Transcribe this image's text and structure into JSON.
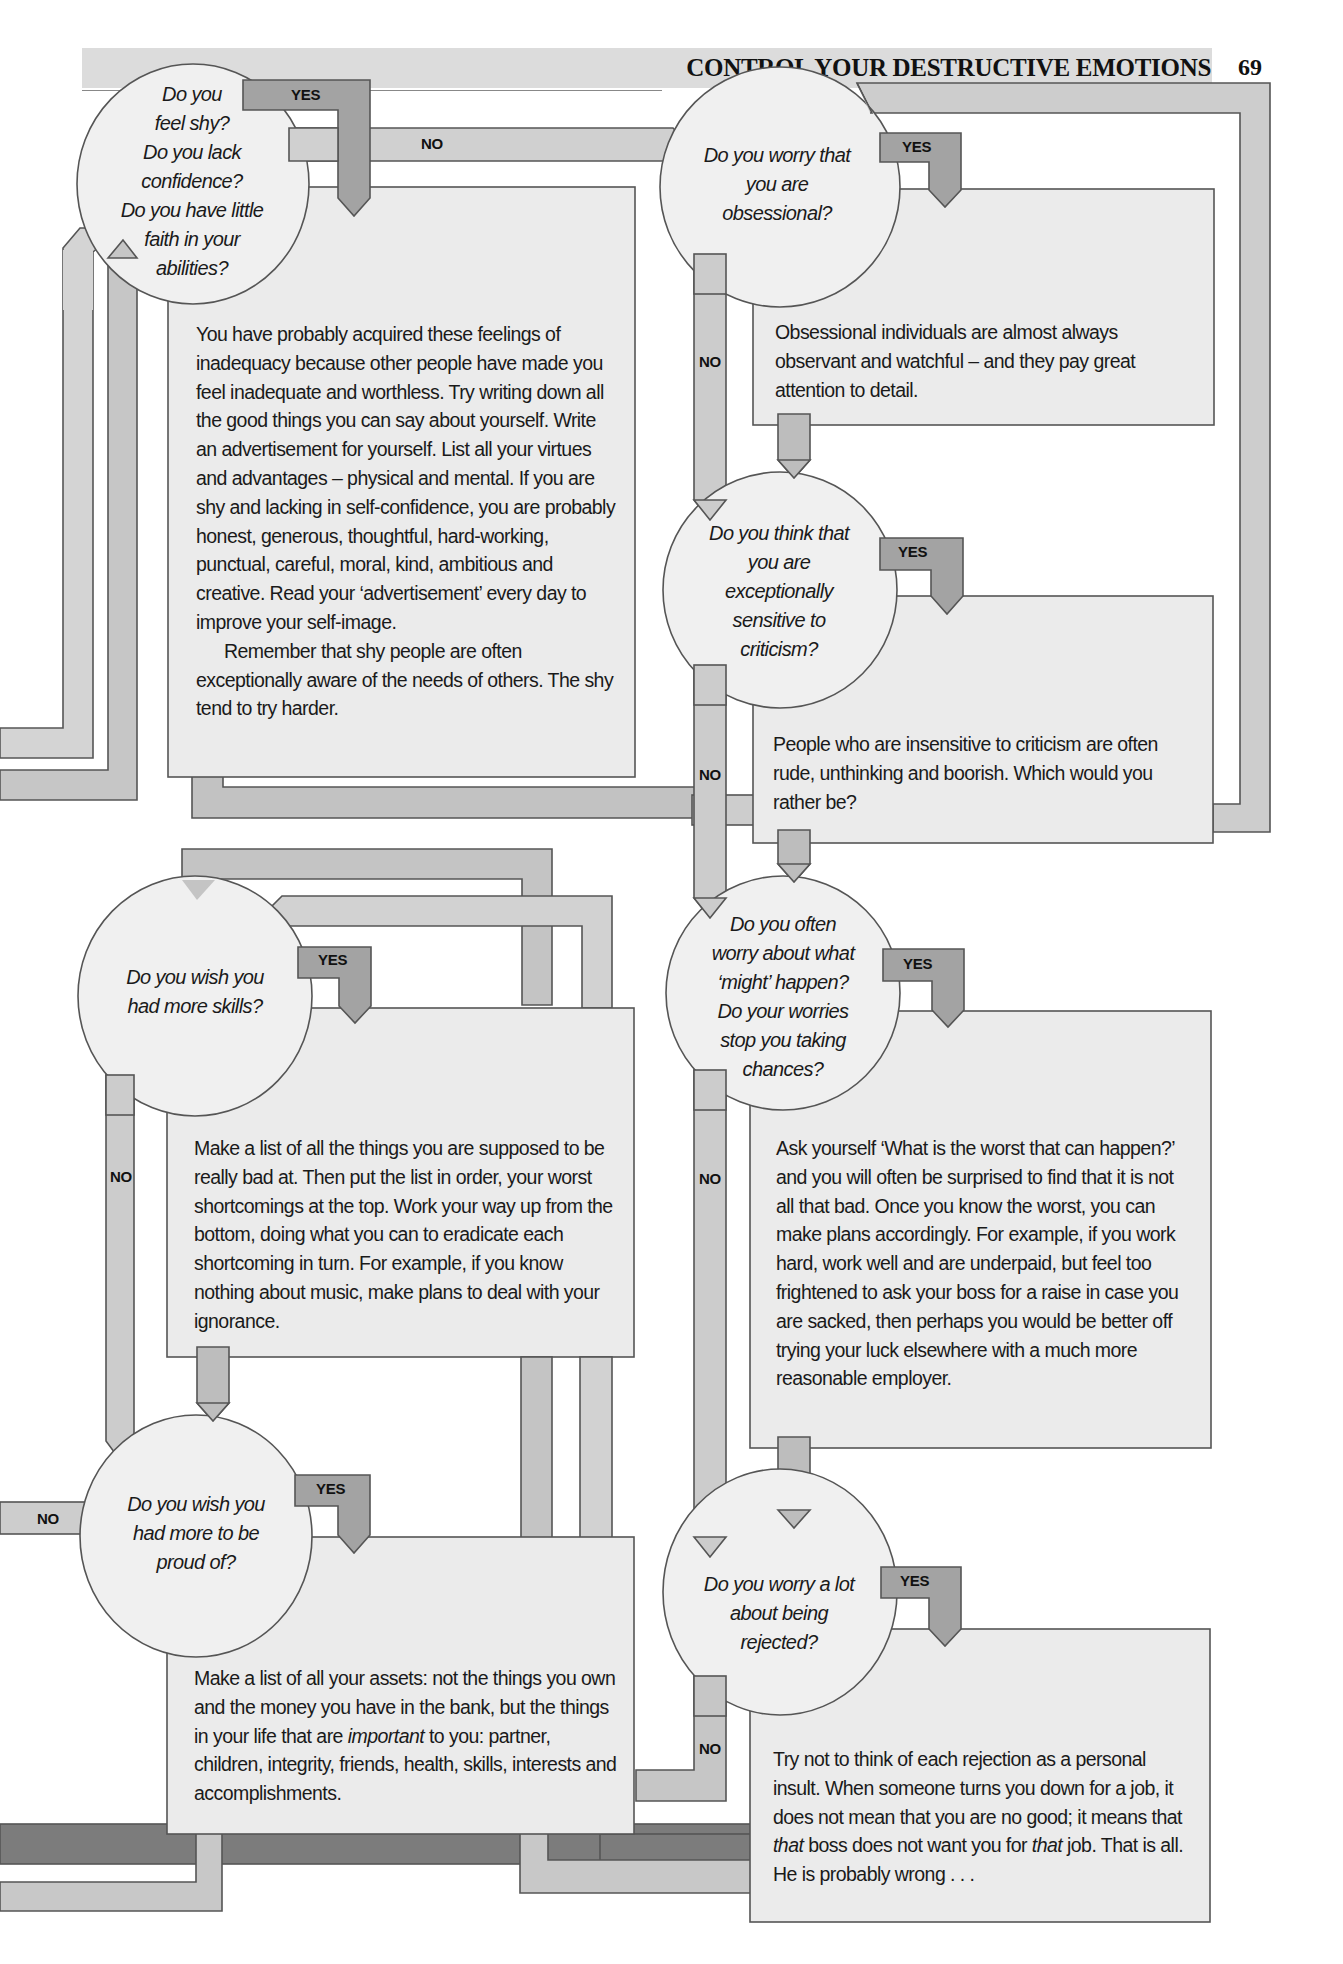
{
  "header": {
    "title": "CONTROL YOUR DESTRUCTIVE EMOTIONS",
    "page_number": "69"
  },
  "colors": {
    "circle_fill": "#f0f0f0",
    "box_fill": "#ececec",
    "arrow_light": "#cfcfcf",
    "arrow_mid": "#b4b4b4",
    "arrow_dark": "#7a7a7a",
    "outline": "#555555",
    "header_bg": "#dcdcdc"
  },
  "labels": {
    "yes": "YES",
    "no": "NO"
  },
  "flowchart": {
    "questions": [
      {
        "id": "shy",
        "lines": [
          "Do you",
          "feel shy?",
          "Do you lack",
          "confidence?",
          "Do you have little",
          "faith in your",
          "abilities?"
        ]
      },
      {
        "id": "obsessional",
        "lines": [
          "Do you worry that",
          "you are",
          "obsessional?"
        ]
      },
      {
        "id": "criticism",
        "lines": [
          "Do you think that",
          "you are",
          "exceptionally",
          "sensitive to",
          "criticism?"
        ]
      },
      {
        "id": "skills",
        "lines": [
          "Do you wish you",
          "had more skills?"
        ]
      },
      {
        "id": "worry",
        "lines": [
          "Do you often",
          "worry about what",
          "‘might’ happen?",
          "Do your worries",
          "stop you taking",
          "chances?"
        ]
      },
      {
        "id": "proud",
        "lines": [
          "Do you wish you",
          "had more to be",
          "proud of?"
        ]
      },
      {
        "id": "rejected",
        "lines": [
          "Do you worry a lot",
          "about being",
          "rejected?"
        ]
      }
    ],
    "answers": [
      {
        "id": "shy",
        "paragraphs": [
          "You have probably acquired these feelings of inadequacy because other people have made you feel inadequate and worthless. Try writing down all the good things you can say about yourself. Write an advertisement for yourself. List all your virtues and advantages – physical and mental. If you are shy and lacking in self-confidence, you are probably honest, generous, thoughtful, hard-working, punctual, careful, moral, kind, ambitious and creative. Read your ‘advertisement’ every day to improve your self-image.",
          "Remember that shy people are often exceptionally aware of the needs of others. The shy tend to try harder."
        ]
      },
      {
        "id": "obsessional",
        "paragraphs": [
          "Obsessional individuals are almost always observant and watchful – and they pay great attention to detail."
        ]
      },
      {
        "id": "criticism",
        "paragraphs": [
          "People who are insensitive to criticism are often rude, unthinking and boorish. Which would you rather be?"
        ]
      },
      {
        "id": "skills",
        "paragraphs": [
          "Make a list of all the things you are supposed to be really bad at. Then put the list in order, your worst shortcomings at the top. Work your way up from the bottom, doing what you can to eradicate each shortcoming in turn. For example, if you know nothing about music, make plans to deal with your ignorance."
        ]
      },
      {
        "id": "worry",
        "paragraphs": [
          "Ask yourself ‘What is the worst that can happen?’ and you will often be surprised to find that it is not all that bad. Once you know the worst, you can make plans accordingly. For example, if you work hard, work well and are underpaid, but feel too frightened to ask your boss for a raise in case you are sacked, then perhaps you would be better off trying your luck elsewhere with a much more reasonable employer."
        ]
      },
      {
        "id": "proud",
        "p_before": "Make a list of all your assets: not the things you own and the money you have in the bank, but the things in your life that are ",
        "p_em": "important",
        "p_after": " to you: partner, children, integrity, friends, health, skills, interests and accomplishments."
      },
      {
        "id": "rejected",
        "p1": "Try not to think of each rejection as a personal insult. When someone turns you down for a job, it does not mean that you are no good; it means that ",
        "em1": "that",
        "p2": " boss does not want you for ",
        "em2": "that",
        "p3": " job. That is all. He is probably wrong . . ."
      }
    ]
  }
}
